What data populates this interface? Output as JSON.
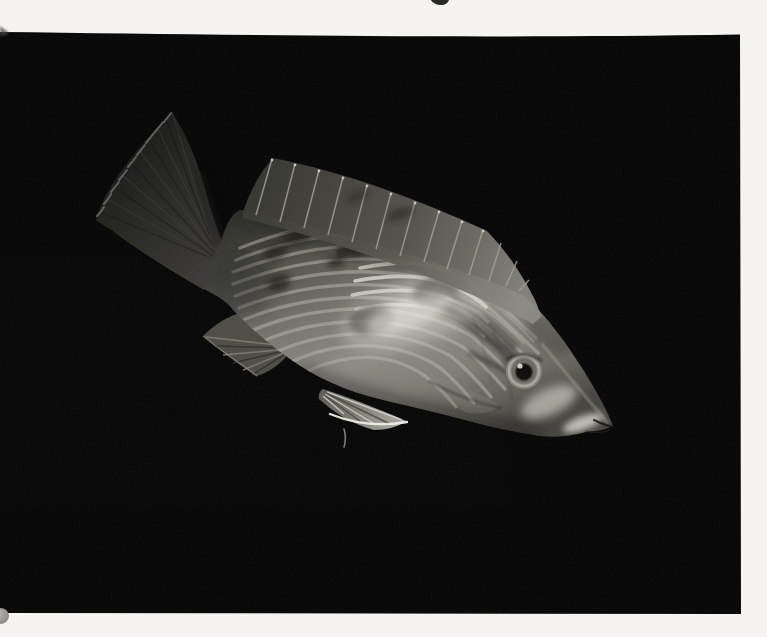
{
  "meta": {
    "type": "photograph",
    "alt": "Book-plate style photograph of a striped fish with dark blotches, spiny dorsal fin and pointed snout, swimming head-down against a pure black background, printed on a white page",
    "orientation": "head lower-right, tail upper-left"
  },
  "colors": {
    "page_background": "#f5f4f1",
    "photo_background": "#050505",
    "fish_base": "#81807a",
    "fish_highlight": "#efeee6",
    "stripe_light": "#b4b3aa",
    "marking_dark": "#1b1b18",
    "fin_dark": "#34342f",
    "eye_pupil": "#0c0c0a",
    "page_edge_smudge": "#a3a29e"
  },
  "artifacts": {
    "top_edge_text_fragment": "partial letter descender cut off at top page edge",
    "bottom_left_smudge": "small grey smudge on page at lower-left photo edge"
  }
}
